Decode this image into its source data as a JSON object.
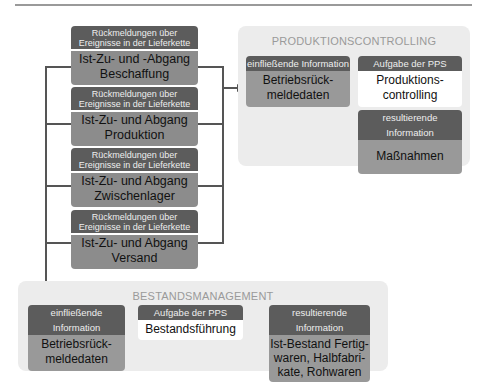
{
  "event_header": "Rückmeldungen über Ereignisse in der Lieferkette",
  "events": [
    {
      "header": "Rückmeldungen über Ereignisse in der Lieferkette",
      "line1": "Ist-Zu- und -Abgang",
      "line2": "Beschaffung"
    },
    {
      "header": "Rückmeldungen über Ereignisse in der Lieferkette",
      "line1": "Ist-Zu- und Abgang",
      "line2": "Produktion"
    },
    {
      "header": "Rückmeldungen über Ereignisse in der Lieferkette",
      "line1": "Ist-Zu- und Abgang",
      "line2": "Zwischenlager"
    },
    {
      "header": "Rückmeldungen über Ereignisse in der Lieferkette",
      "line1": "Ist-Zu- und Abgang",
      "line2": "Versand"
    }
  ],
  "produktionscontrolling": {
    "title": "PRODUKTIONSCONTROLLING",
    "input": {
      "header": "einfließende Information",
      "line1": "Betriebsrück-",
      "line2": "meldedaten"
    },
    "task": {
      "header": "Aufgabe der PPS",
      "line1": "Produktions-",
      "line2": "controlling"
    },
    "result": {
      "header": "resultierende Information",
      "line1": "Maßnahmen"
    }
  },
  "bestandsmanagement": {
    "title": "BESTANDSMANAGEMENT",
    "input": {
      "header": "einfließende Information",
      "line1": "Betriebsrück-",
      "line2": "meldedaten"
    },
    "task": {
      "header": "Aufgabe der PPS",
      "line1": "Bestandsführung"
    },
    "result": {
      "header": "resultierende Information",
      "line1": "Ist-Bestand Fertig-",
      "line2": "waren, Halbfabri-",
      "line3": "kate, Rohwaren"
    }
  },
  "colors": {
    "dark_header": "#5c5c5c",
    "mid_grey": "#8c8c8c",
    "panel_bg": "#ececec",
    "connector": "#555555"
  }
}
